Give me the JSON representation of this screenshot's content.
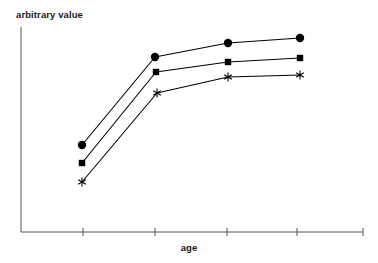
{
  "chart_data": {
    "type": "line",
    "title": "",
    "subtitle": "",
    "xlabel": "age",
    "ylabel": "arbitrary value",
    "x": [
      1,
      2,
      3,
      4
    ],
    "xlim": [
      0.5,
      4.6
    ],
    "ylim": [
      0,
      10
    ],
    "grid": false,
    "legend": false,
    "legend_position": "none",
    "x_tick_labels": [
      "",
      "",
      "",
      "",
      ""
    ],
    "y_tick_labels": [],
    "annotations": [],
    "axis_color": "#555555",
    "line_color": "#000000",
    "marker_color": "#000000",
    "background_color": "#ffffff",
    "series": [
      {
        "name": "series-1",
        "marker": "circle",
        "values": [
          3.35,
          8.0,
          8.75,
          9.0
        ],
        "points_px": [
          {
            "x": 82,
            "y": 145
          },
          {
            "x": 155,
            "y": 57
          },
          {
            "x": 228,
            "y": 43
          },
          {
            "x": 300,
            "y": 38
          }
        ]
      },
      {
        "name": "series-2",
        "marker": "square",
        "values": [
          2.45,
          7.25,
          7.75,
          8.0
        ],
        "points_px": [
          {
            "x": 82,
            "y": 163
          },
          {
            "x": 156,
            "y": 72
          },
          {
            "x": 228,
            "y": 62
          },
          {
            "x": 300,
            "y": 58
          }
        ]
      },
      {
        "name": "series-3",
        "marker": "asterisk",
        "values": [
          1.45,
          6.2,
          7.0,
          7.1
        ],
        "points_px": [
          {
            "x": 82,
            "y": 182
          },
          {
            "x": 157,
            "y": 93
          },
          {
            "x": 228,
            "y": 77
          },
          {
            "x": 300,
            "y": 75
          }
        ]
      }
    ],
    "axes_px": {
      "y_axis": {
        "x": 21,
        "y_top": 27,
        "y_bottom": 232
      },
      "x_axis": {
        "y": 232,
        "x_left": 21,
        "x_right": 363
      },
      "x_ticks": [
        83,
        155,
        227,
        297,
        363
      ]
    }
  }
}
